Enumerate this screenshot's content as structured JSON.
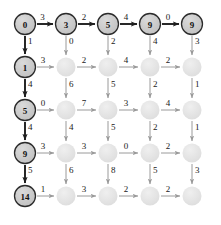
{
  "figure": {
    "type": "grid-graph-diagram",
    "rows": 5,
    "cols": 5,
    "width": 221,
    "height": 225,
    "background": "#ffffff"
  },
  "colors": {
    "labeled_node_fill": "#c9c9c9",
    "labeled_node_stroke": "#2b2b2b",
    "plain_node_fill": "#e2e2e2",
    "highlight_edge": "#1d1d1d",
    "normal_edge": "#9a9a9a",
    "label_text": "#1a1a1a",
    "node_text": "#111111"
  },
  "geometry": {
    "x_positions": [
      25,
      66,
      108,
      150,
      192
    ],
    "y_positions": [
      24,
      67,
      110,
      153,
      196
    ],
    "labeled_radius": 10.5,
    "plain_radius": 9.5
  },
  "nodes": [
    {
      "id": "n00",
      "row": 0,
      "col": 0,
      "label": "0",
      "labeled": true
    },
    {
      "id": "n01",
      "row": 0,
      "col": 1,
      "label": "3",
      "labeled": true
    },
    {
      "id": "n02",
      "row": 0,
      "col": 2,
      "label": "5",
      "labeled": true
    },
    {
      "id": "n03",
      "row": 0,
      "col": 3,
      "label": "9",
      "labeled": true
    },
    {
      "id": "n04",
      "row": 0,
      "col": 4,
      "label": "9",
      "labeled": true
    },
    {
      "id": "n10",
      "row": 1,
      "col": 0,
      "label": "1",
      "labeled": true
    },
    {
      "id": "n11",
      "row": 1,
      "col": 1,
      "label": "",
      "labeled": false
    },
    {
      "id": "n12",
      "row": 1,
      "col": 2,
      "label": "",
      "labeled": false
    },
    {
      "id": "n13",
      "row": 1,
      "col": 3,
      "label": "",
      "labeled": false
    },
    {
      "id": "n14",
      "row": 1,
      "col": 4,
      "label": "",
      "labeled": false
    },
    {
      "id": "n20",
      "row": 2,
      "col": 0,
      "label": "5",
      "labeled": true
    },
    {
      "id": "n21",
      "row": 2,
      "col": 1,
      "label": "",
      "labeled": false
    },
    {
      "id": "n22",
      "row": 2,
      "col": 2,
      "label": "",
      "labeled": false
    },
    {
      "id": "n23",
      "row": 2,
      "col": 3,
      "label": "",
      "labeled": false
    },
    {
      "id": "n24",
      "row": 2,
      "col": 4,
      "label": "",
      "labeled": false
    },
    {
      "id": "n30",
      "row": 3,
      "col": 0,
      "label": "9",
      "labeled": true
    },
    {
      "id": "n31",
      "row": 3,
      "col": 1,
      "label": "",
      "labeled": false
    },
    {
      "id": "n32",
      "row": 3,
      "col": 2,
      "label": "",
      "labeled": false
    },
    {
      "id": "n33",
      "row": 3,
      "col": 3,
      "label": "",
      "labeled": false
    },
    {
      "id": "n34",
      "row": 3,
      "col": 4,
      "label": "",
      "labeled": false
    },
    {
      "id": "n40",
      "row": 4,
      "col": 0,
      "label": "14",
      "labeled": true
    },
    {
      "id": "n41",
      "row": 4,
      "col": 1,
      "label": "",
      "labeled": false
    },
    {
      "id": "n42",
      "row": 4,
      "col": 2,
      "label": "",
      "labeled": false
    },
    {
      "id": "n43",
      "row": 4,
      "col": 3,
      "label": "",
      "labeled": false
    },
    {
      "id": "n44",
      "row": 4,
      "col": 4,
      "label": "",
      "labeled": false
    }
  ],
  "horizontal_edges": [
    {
      "row": 0,
      "col": 0,
      "weight": "3",
      "highlight": true
    },
    {
      "row": 0,
      "col": 1,
      "weight": "2",
      "highlight": true
    },
    {
      "row": 0,
      "col": 2,
      "weight": "4",
      "highlight": true
    },
    {
      "row": 0,
      "col": 3,
      "weight": "0",
      "highlight": true
    },
    {
      "row": 1,
      "col": 0,
      "weight": "3",
      "highlight": false
    },
    {
      "row": 1,
      "col": 1,
      "weight": "2",
      "highlight": false
    },
    {
      "row": 1,
      "col": 2,
      "weight": "4",
      "highlight": false
    },
    {
      "row": 1,
      "col": 3,
      "weight": "2",
      "highlight": false
    },
    {
      "row": 2,
      "col": 0,
      "weight": "0",
      "highlight": false
    },
    {
      "row": 2,
      "col": 1,
      "weight": "7",
      "highlight": false
    },
    {
      "row": 2,
      "col": 2,
      "weight": "3",
      "highlight": false
    },
    {
      "row": 2,
      "col": 3,
      "weight": "4",
      "highlight": false
    },
    {
      "row": 3,
      "col": 0,
      "weight": "3",
      "highlight": false
    },
    {
      "row": 3,
      "col": 1,
      "weight": "3",
      "highlight": false
    },
    {
      "row": 3,
      "col": 2,
      "weight": "0",
      "highlight": false
    },
    {
      "row": 3,
      "col": 3,
      "weight": "2",
      "highlight": false
    },
    {
      "row": 4,
      "col": 0,
      "weight": "1",
      "highlight": false
    },
    {
      "row": 4,
      "col": 1,
      "weight": "3",
      "highlight": false
    },
    {
      "row": 4,
      "col": 2,
      "weight": "2",
      "highlight": false
    },
    {
      "row": 4,
      "col": 3,
      "weight": "2",
      "highlight": false
    }
  ],
  "vertical_edges": [
    {
      "row": 0,
      "col": 0,
      "weight": "1",
      "highlight": true
    },
    {
      "row": 0,
      "col": 1,
      "weight": "0",
      "highlight": false
    },
    {
      "row": 0,
      "col": 2,
      "weight": "2",
      "highlight": false
    },
    {
      "row": 0,
      "col": 3,
      "weight": "4",
      "highlight": false
    },
    {
      "row": 0,
      "col": 4,
      "weight": "3",
      "highlight": false
    },
    {
      "row": 1,
      "col": 0,
      "weight": "4",
      "highlight": true
    },
    {
      "row": 1,
      "col": 1,
      "weight": "6",
      "highlight": false
    },
    {
      "row": 1,
      "col": 2,
      "weight": "5",
      "highlight": false
    },
    {
      "row": 1,
      "col": 3,
      "weight": "2",
      "highlight": false
    },
    {
      "row": 1,
      "col": 4,
      "weight": "1",
      "highlight": false
    },
    {
      "row": 2,
      "col": 0,
      "weight": "4",
      "highlight": true
    },
    {
      "row": 2,
      "col": 1,
      "weight": "4",
      "highlight": false
    },
    {
      "row": 2,
      "col": 2,
      "weight": "5",
      "highlight": false
    },
    {
      "row": 2,
      "col": 3,
      "weight": "2",
      "highlight": false
    },
    {
      "row": 2,
      "col": 4,
      "weight": "1",
      "highlight": false
    },
    {
      "row": 3,
      "col": 0,
      "weight": "5",
      "highlight": true
    },
    {
      "row": 3,
      "col": 1,
      "weight": "6",
      "highlight": false
    },
    {
      "row": 3,
      "col": 2,
      "weight": "8",
      "highlight": false
    },
    {
      "row": 3,
      "col": 3,
      "weight": "5",
      "highlight": false
    },
    {
      "row": 3,
      "col": 4,
      "weight": "3",
      "highlight": false
    }
  ]
}
